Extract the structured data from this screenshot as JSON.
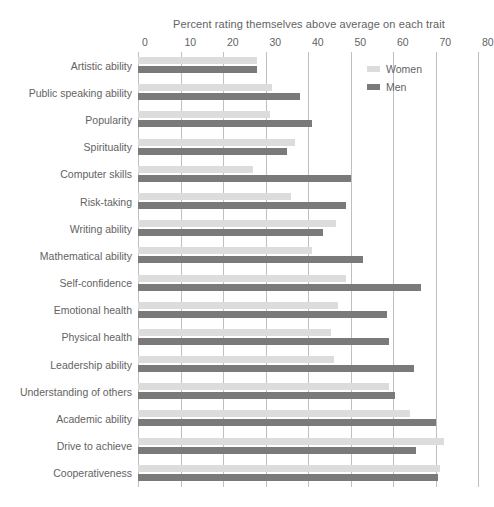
{
  "chart_data": {
    "type": "bar",
    "orientation": "horizontal",
    "title": "Percent rating themselves above average on each trait",
    "xlabel": "",
    "ylabel": "",
    "xlim": [
      0,
      80
    ],
    "xticks": [
      0,
      10,
      20,
      30,
      40,
      50,
      60,
      70,
      80
    ],
    "grid": "vertical",
    "legend_position": "top-right",
    "categories": [
      "Artistic ability",
      "Public speaking ability",
      "Popularity",
      "Spirituality",
      "Computer skills",
      "Risk-taking",
      "Writing ability",
      "Mathematical ability",
      "Self-confidence",
      "Emotional health",
      "Physical health",
      "Leadership ability",
      "Understanding of others",
      "Academic ability",
      "Drive to achieve",
      "Cooperativeness"
    ],
    "series": [
      {
        "name": "Women",
        "color": "#dcdcdc",
        "values": [
          28,
          31.5,
          31,
          37,
          27,
          36,
          46.5,
          41,
          49,
          47,
          45.5,
          46,
          59,
          64,
          72,
          71
        ]
      },
      {
        "name": "Men",
        "color": "#7a7a7a",
        "values": [
          28,
          38,
          41,
          35,
          50,
          49,
          43.5,
          53,
          66.5,
          58.5,
          59,
          65,
          60.5,
          70,
          65.5,
          70.5
        ]
      }
    ]
  },
  "axis": {
    "tick_labels": [
      "0",
      "10",
      "20",
      "30",
      "40",
      "50",
      "60",
      "70",
      "80"
    ]
  },
  "legend": {
    "entries": [
      {
        "label": "Women",
        "swatch": "women-swatch"
      },
      {
        "label": "Men",
        "swatch": "men-swatch"
      }
    ]
  },
  "colors": {
    "women": "#dcdcdc",
    "men": "#7a7a7a",
    "gridline": "#bfbfbf",
    "text": "#636363",
    "background": "#ffffff"
  }
}
